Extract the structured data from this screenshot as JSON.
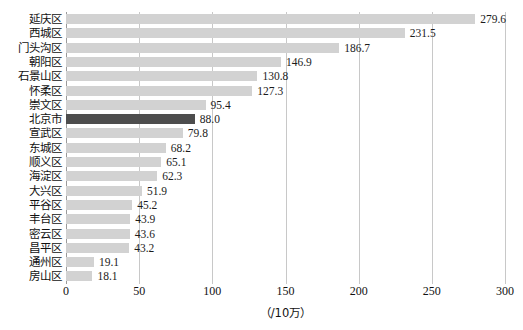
{
  "chart_data": {
    "type": "bar",
    "orientation": "horizontal",
    "title": "",
    "xlabel": "（/10万）",
    "ylabel": "",
    "xlim": [
      0,
      300
    ],
    "xticks": [
      0,
      50,
      100,
      150,
      200,
      250,
      300
    ],
    "xtick_labels": [
      "0",
      "50",
      "100",
      "150",
      "200",
      "250",
      "300"
    ],
    "grid": true,
    "grid_axis": "x",
    "legend": false,
    "categories": [
      "延庆区",
      "西城区",
      "门头沟区",
      "朝阳区",
      "石景山区",
      "怀柔区",
      "崇文区",
      "北京市",
      "宣武区",
      "东城区",
      "顺义区",
      "海淀区",
      "大兴区",
      "平谷区",
      "丰台区",
      "密云区",
      "昌平区",
      "通州区",
      "房山区"
    ],
    "values": [
      279.6,
      231.5,
      186.7,
      146.9,
      130.8,
      127.3,
      95.4,
      88.0,
      79.8,
      68.2,
      65.1,
      62.3,
      51.9,
      45.2,
      43.9,
      43.6,
      43.2,
      19.1,
      18.1
    ],
    "value_labels": [
      "279.6",
      "231.5",
      "186.7",
      "146.9",
      "130.8",
      "127.3",
      "95.4",
      "88.0",
      "79.8",
      "68.2",
      "65.1",
      "62.3",
      "51.9",
      "45.2",
      "43.9",
      "43.6",
      "43.2",
      "19.1",
      "18.1"
    ],
    "highlighted_categories": [
      "北京市"
    ],
    "colors": {
      "bar": "#d2d2d2",
      "bar_highlight": "#4d4d4d",
      "gridline": "#c8c8c8",
      "axis": "#9a9a9a",
      "text": "#111111",
      "background": "#ffffff"
    }
  }
}
